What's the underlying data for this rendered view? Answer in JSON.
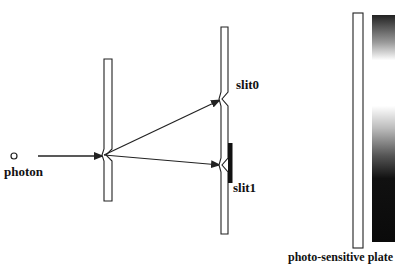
{
  "labels": {
    "photon": "photon",
    "slit0": "slit0",
    "slit1": "slit1",
    "plate": "photo-sensitive plate"
  },
  "colors": {
    "stroke": "#222222",
    "blocker": "#111111",
    "background": "#ffffff"
  },
  "gradient_stops": [
    {
      "offset": "0%",
      "color": "#222222"
    },
    {
      "offset": "12%",
      "color": "#999999"
    },
    {
      "offset": "20%",
      "color": "#ffffff"
    },
    {
      "offset": "40%",
      "color": "#ffffff"
    },
    {
      "offset": "50%",
      "color": "#bbbbbb"
    },
    {
      "offset": "62%",
      "color": "#555555"
    },
    {
      "offset": "72%",
      "color": "#111111"
    },
    {
      "offset": "100%",
      "color": "#0a0a0a"
    }
  ]
}
